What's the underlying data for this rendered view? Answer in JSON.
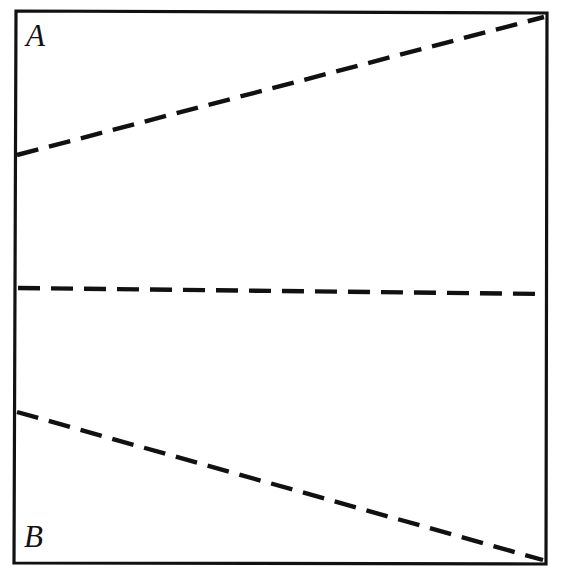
{
  "figure": {
    "type": "line-diagram",
    "background_color": "#ffffff",
    "stroke_color": "#111111",
    "width": 570,
    "height": 580,
    "frame": {
      "name": "rectangular-border",
      "style": "solid",
      "stroke_width": 3.2,
      "corners": {
        "top_left": [
          16,
          11
        ],
        "top_right": [
          547,
          13
        ],
        "bottom_right": [
          546,
          564
        ],
        "bottom_left": [
          14,
          563
        ]
      }
    },
    "labels": [
      {
        "id": "A",
        "text": "A",
        "position": "top-left-inside",
        "x": 26,
        "y": 20,
        "font_style": "italic-serif",
        "font_size": 31
      },
      {
        "id": "B",
        "text": "B",
        "position": "bottom-left-inside",
        "x": 24,
        "y": 521,
        "font_style": "italic-serif",
        "font_size": 31
      }
    ],
    "dashed_lines": [
      {
        "id": "upper-line",
        "name": "upper-dashed-line",
        "description": "rises from left edge to the top-right corner",
        "start": [
          17,
          155
        ],
        "end": [
          544,
          17
        ],
        "dash": 22,
        "gap": 11,
        "stroke_width": 4.4
      },
      {
        "id": "middle-line",
        "name": "middle-dashed-line",
        "description": "nearly horizontal, spans left edge to right edge",
        "start": [
          18,
          288
        ],
        "end": [
          545,
          294
        ],
        "dash": 22,
        "gap": 11,
        "stroke_width": 4.4
      },
      {
        "id": "lower-line",
        "name": "lower-dashed-line",
        "description": "descends from left edge to the bottom-right corner",
        "start": [
          17,
          412
        ],
        "end": [
          543,
          560
        ],
        "dash": 22,
        "gap": 11,
        "stroke_width": 4.4
      }
    ]
  },
  "chart_data": {
    "type": "line",
    "title": "",
    "xlabel": "",
    "ylabel": "",
    "grid": false,
    "legend": "none",
    "annotations": [
      "A",
      "B"
    ],
    "xlim": [
      16,
      547
    ],
    "ylim": [
      564,
      11
    ],
    "series": [
      {
        "name": "upper-line",
        "style": "dashed",
        "x": [
          17,
          544
        ],
        "y": [
          155,
          17
        ]
      },
      {
        "name": "middle-line",
        "style": "dashed",
        "x": [
          18,
          545
        ],
        "y": [
          288,
          294
        ]
      },
      {
        "name": "lower-line",
        "style": "dashed",
        "x": [
          17,
          543
        ],
        "y": [
          412,
          560
        ]
      }
    ]
  }
}
